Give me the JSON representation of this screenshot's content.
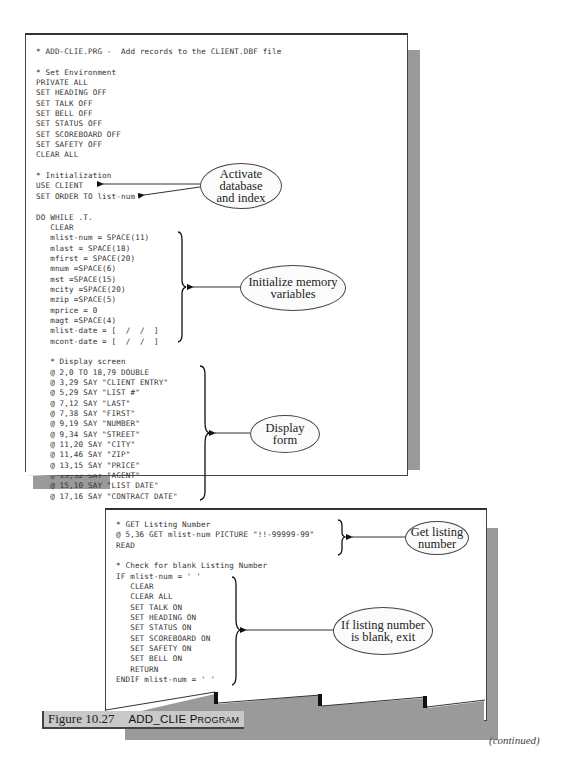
{
  "figure": {
    "label": "Figure 10.27",
    "title_main": "ADD_CLIE P",
    "title_small": "ROGRAM",
    "continued": "(continued)"
  },
  "page1": {
    "lines": [
      "* ADD-CLIE.PRG -  Add records to the CLIENT.DBF file",
      "",
      "* Set Environment",
      "PRIVATE ALL",
      "SET HEADING OFF",
      "SET TALK OFF",
      "SET BELL OFF",
      "SET STATUS OFF",
      "SET SCOREBOARD OFF",
      "SET SAFETY OFF",
      "CLEAR ALL",
      "",
      "* Initialization",
      "USE CLIENT",
      "SET ORDER TO list-num",
      "",
      "DO WHILE .T.",
      "   CLEAR",
      "   mlist-num = SPACE(11)",
      "   mlast = SPACE(18)",
      "   mfirst = SPACE(20)",
      "   mnum =SPACE(6)",
      "   mst =SPACE(15)",
      "   mcity =SPACE(20)",
      "   mzip =SPACE(5)",
      "   mprice = 0",
      "   magt =SPACE(4)",
      "   mlist-date = [  /  /  ]",
      "   mcont-date = [  /  /  ]",
      "",
      "   * Display screen",
      "   @ 2,0 TO 18,79 DOUBLE",
      "   @ 3,29 SAY \"CLIENT ENTRY\"",
      "   @ 5,29 SAY \"LIST #\"",
      "   @ 7,12 SAY \"LAST\"",
      "   @ 7,38 SAY \"FIRST\"",
      "   @ 9,19 SAY \"NUMBER\"",
      "   @ 9,34 SAY \"STREET\"",
      "   @ 11,20 SAY \"CITY\"",
      "   @ 11,46 SAY \"ZIP\"",
      "   @ 13,15 SAY \"PRICE\"",
      "   @ 13,32 SAY \"AGENT\"",
      "   @ 15,10 SAY \"LIST DATE\"",
      "   @ 17,16 SAY \"CONTRACT DATE\""
    ]
  },
  "page2": {
    "lines": [
      "* GET Listing Number",
      "@ 5,36 GET mlist-num PICTURE \"!!-99999-99\"",
      "READ",
      "",
      "* Check for blank Listing Number",
      "IF mlist-num = ' '",
      "   CLEAR",
      "   CLEAR ALL",
      "   SET TALK ON",
      "   SET HEADING ON",
      "   SET STATUS ON",
      "   SET SCOREBOARD ON",
      "   SET SAFETY ON",
      "   SET BELL ON",
      "   RETURN",
      "ENDIF mlist-num = ' '"
    ]
  },
  "callouts": {
    "activate": "Activate database and index",
    "initialize": "Initialize memory variables",
    "display": "Display form",
    "get_listing": "Get listing number",
    "blank_exit": "If listing number is blank, exit"
  },
  "colors": {
    "shadow": "#9a9a9a",
    "caption_bg": "#c9c9c9",
    "ink": "#333333"
  }
}
